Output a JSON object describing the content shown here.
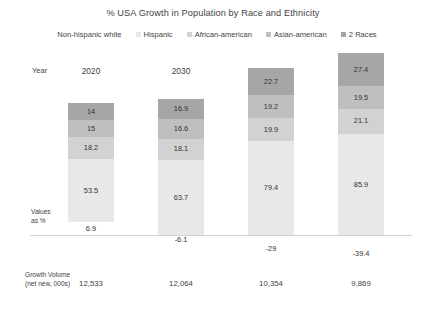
{
  "chart_data": {
    "type": "bar",
    "subtype": "stacked-bar",
    "title": "% USA Growth in Population by Race and Ethnicity",
    "xlabel": "Year",
    "ylabel": "Values as %",
    "grid": false,
    "legend_position": "top",
    "categories": [
      "2020",
      "2030",
      "2040",
      "2050"
    ],
    "series": [
      {
        "name": "Non-hispanic white",
        "color": "#ffffff",
        "values": [
          6.9,
          -6.1,
          -29,
          -39.4
        ]
      },
      {
        "name": "Hispanic",
        "color": "#e8e8e8",
        "values": [
          53.5,
          63.7,
          79.4,
          85.9
        ]
      },
      {
        "name": "African-american",
        "color": "#d2d2d2",
        "values": [
          18.2,
          18.1,
          19.9,
          21.1
        ]
      },
      {
        "name": "Asian-american",
        "color": "#bfbfbf",
        "values": [
          15,
          16.6,
          19.2,
          19.5
        ]
      },
      {
        "name": "2 Races",
        "color": "#a6a6a6",
        "values": [
          14,
          16.9,
          22.7,
          27.4
        ]
      }
    ],
    "annotations": {
      "footer_label_line1": "Growth Volume",
      "footer_label_line2": "(net new, 000s)",
      "footer_values": [
        "12,533",
        "12,064",
        "10,354",
        "9,869"
      ]
    }
  },
  "header": {
    "title": "% USA Growth in Population by Race and Ethnicity"
  },
  "legend": {
    "items": [
      {
        "label": "Non-hispanic white",
        "color": "#ffffff"
      },
      {
        "label": "Hispanic",
        "color": "#e8e8e8"
      },
      {
        "label": "African-american",
        "color": "#d2d2d2"
      },
      {
        "label": "Asian-american",
        "color": "#bfbfbf"
      },
      {
        "label": "2 Races",
        "color": "#a6a6a6"
      }
    ]
  },
  "axis": {
    "year_label": "Year",
    "values_label_line1": "Values",
    "values_label_line2": "as %",
    "years": [
      "2020",
      "2030",
      "2040",
      "2050"
    ]
  },
  "columns": [
    {
      "year": "2020",
      "segments": [
        {
          "series": "2 Races",
          "value": "14",
          "color": "#a6a6a6"
        },
        {
          "series": "Asian-american",
          "value": "15",
          "color": "#bfbfbf"
        },
        {
          "series": "African-american",
          "value": "18.2",
          "color": "#d2d2d2"
        },
        {
          "series": "Hispanic",
          "value": "53.5",
          "color": "#e8e8e8"
        }
      ],
      "white_segment": {
        "series": "Non-hispanic white",
        "value": "6.9",
        "color": "#ffffff",
        "negative": false
      },
      "growth_volume": "12,533"
    },
    {
      "year": "2030",
      "segments": [
        {
          "series": "2 Races",
          "value": "16.9",
          "color": "#a6a6a6"
        },
        {
          "series": "Asian-american",
          "value": "16.6",
          "color": "#bfbfbf"
        },
        {
          "series": "African-american",
          "value": "18.1",
          "color": "#d2d2d2"
        },
        {
          "series": "Hispanic",
          "value": "63.7",
          "color": "#e8e8e8"
        }
      ],
      "white_segment": {
        "series": "Non-hispanic white",
        "value": "-6.1",
        "color": "#ffffff",
        "negative": true
      },
      "growth_volume": "12,064"
    },
    {
      "year": "2040",
      "segments": [
        {
          "series": "2 Races",
          "value": "22.7",
          "color": "#a6a6a6"
        },
        {
          "series": "Asian-american",
          "value": "19.2",
          "color": "#bfbfbf"
        },
        {
          "series": "African-american",
          "value": "19.9",
          "color": "#d2d2d2"
        },
        {
          "series": "Hispanic",
          "value": "79.4",
          "color": "#e8e8e8"
        }
      ],
      "white_segment": {
        "series": "Non-hispanic white",
        "value": "-29",
        "color": "#ffffff",
        "negative": true
      },
      "growth_volume": "10,354"
    },
    {
      "year": "2050",
      "segments": [
        {
          "series": "2 Races",
          "value": "27.4",
          "color": "#a6a6a6"
        },
        {
          "series": "Asian-american",
          "value": "19.5",
          "color": "#bfbfbf"
        },
        {
          "series": "African-american",
          "value": "21.1",
          "color": "#d2d2d2"
        },
        {
          "series": "Hispanic",
          "value": "85.9",
          "color": "#e8e8e8"
        }
      ],
      "white_segment": {
        "series": "Non-hispanic white",
        "value": "-39.4",
        "color": "#ffffff",
        "negative": true
      },
      "growth_volume": "9,869"
    }
  ],
  "footer": {
    "label_line1": "Growth Volume",
    "label_line2": "(net new, 000s)"
  },
  "style": {
    "background": "#ffffff",
    "text_color": "#3f3f3f",
    "baseline_color": "#d4d4d4"
  }
}
